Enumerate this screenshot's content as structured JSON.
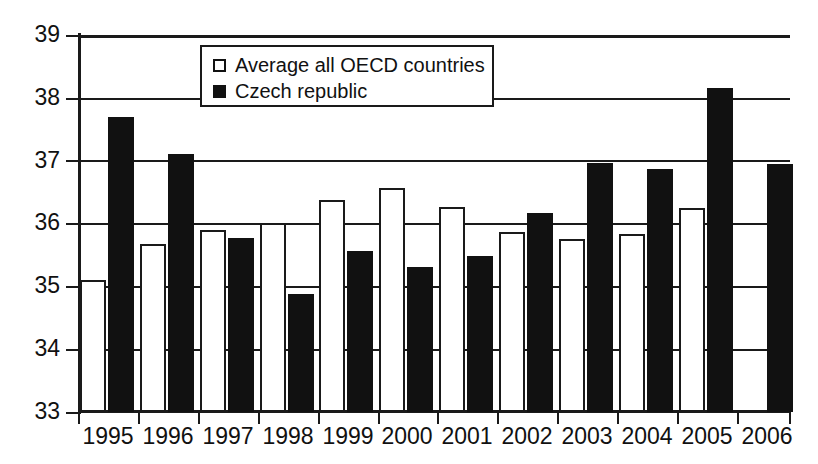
{
  "chart_data": {
    "type": "bar",
    "title": "",
    "xlabel": "",
    "ylabel": "",
    "ylim": [
      33,
      39
    ],
    "ytick_labels": [
      "39",
      "38",
      "37",
      "36",
      "35",
      "34",
      "33"
    ],
    "ytick_values": [
      39,
      38,
      37,
      36,
      35,
      34,
      33
    ],
    "grid": true,
    "legend_position": "top-center-inside",
    "categories": [
      "1995",
      "1996",
      "1997",
      "1998",
      "1999",
      "2000",
      "2001",
      "2002",
      "2003",
      "2004",
      "2005",
      "2006"
    ],
    "series": [
      {
        "name": "Average all OECD countries",
        "style": "white-filled-black-outline",
        "color": "#ffffff",
        "values": [
          35.1,
          35.68,
          35.9,
          36.0,
          36.37,
          36.57,
          36.26,
          35.87,
          35.75,
          35.83,
          36.25,
          null
        ]
      },
      {
        "name": "Czech republic",
        "style": "solid-black",
        "color": "#111111",
        "values": [
          37.7,
          37.1,
          35.77,
          34.88,
          35.56,
          35.3,
          35.48,
          36.17,
          36.97,
          36.87,
          38.15,
          36.95
        ]
      }
    ]
  },
  "legend": {
    "entries": [
      {
        "label": "Average all OECD countries",
        "swatch": "white-square-icon"
      },
      {
        "label": "Czech republic",
        "swatch": "black-square-icon"
      }
    ]
  },
  "axes": {
    "y_labels": [
      "39",
      "38",
      "37",
      "36",
      "35",
      "34",
      "33"
    ],
    "x_labels": [
      "1995",
      "1996",
      "1997",
      "1998",
      "1999",
      "2000",
      "2001",
      "2002",
      "2003",
      "2004",
      "2005",
      "2006"
    ]
  },
  "colors": {
    "axis": "#1a1a1a",
    "grid": "#1a1a1a",
    "series_white": "#ffffff",
    "series_black": "#111111",
    "background": "#ffffff",
    "text": "#111111"
  }
}
